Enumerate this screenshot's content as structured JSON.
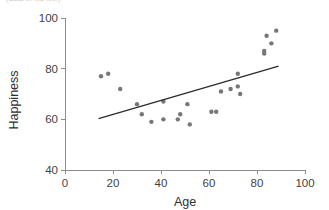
{
  "figure": {
    "clipped_caption": "(data in file xxx)",
    "background_color": "#ffffff"
  },
  "chart_data": {
    "type": "scatter",
    "title": "",
    "xlabel": "Age",
    "ylabel": "Happiness",
    "xlim": [
      0,
      100
    ],
    "ylim": [
      40,
      100
    ],
    "xticks": [
      0,
      20,
      40,
      60,
      80,
      100
    ],
    "yticks": [
      40,
      60,
      80,
      100
    ],
    "xtick_labels": [
      "0",
      "20",
      "40",
      "60",
      "80",
      "100"
    ],
    "ytick_labels": [
      "40",
      "60",
      "80",
      "100"
    ],
    "grid": false,
    "legend": null,
    "point_color": "#77777a",
    "point_radius": 2.2,
    "line_color": "#2b2b2b",
    "points": [
      {
        "x": 15,
        "y": 77
      },
      {
        "x": 18,
        "y": 78
      },
      {
        "x": 23,
        "y": 72
      },
      {
        "x": 30,
        "y": 66
      },
      {
        "x": 32,
        "y": 62
      },
      {
        "x": 36,
        "y": 59
      },
      {
        "x": 41,
        "y": 67
      },
      {
        "x": 41,
        "y": 60
      },
      {
        "x": 47,
        "y": 60
      },
      {
        "x": 48,
        "y": 62
      },
      {
        "x": 51,
        "y": 66
      },
      {
        "x": 52,
        "y": 58
      },
      {
        "x": 61,
        "y": 63
      },
      {
        "x": 63,
        "y": 63
      },
      {
        "x": 65,
        "y": 71
      },
      {
        "x": 69,
        "y": 72
      },
      {
        "x": 72,
        "y": 78
      },
      {
        "x": 72,
        "y": 73
      },
      {
        "x": 73,
        "y": 70
      },
      {
        "x": 83,
        "y": 86
      },
      {
        "x": 83,
        "y": 87
      },
      {
        "x": 84,
        "y": 93
      },
      {
        "x": 86,
        "y": 90
      },
      {
        "x": 88,
        "y": 95
      }
    ],
    "trend_line": {
      "type": "linear-fit",
      "x_start": 14,
      "y_start": 60.3,
      "x_end": 89,
      "y_end": 81.0
    }
  }
}
